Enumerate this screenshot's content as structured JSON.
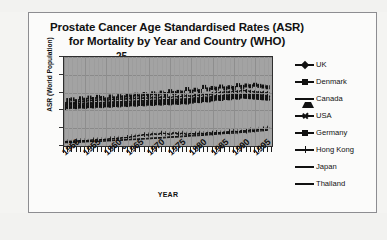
{
  "chart_data": {
    "type": "line",
    "title": "Prostate Cancer Age Standardised Rates (ASR) for Mortality by Year and Country (WHO)",
    "title_lines": [
      "Prostate Cancer Age Standardised Rates (ASR)",
      "for Mortality by Year and Country (WHO)"
    ],
    "xlabel": "YEAR",
    "ylabel": "ASR (World Population)",
    "xlim": [
      1950,
      1999
    ],
    "ylim": [
      0,
      25
    ],
    "yticks": [
      25,
      20,
      15,
      10,
      5,
      0
    ],
    "xticks": [
      1950,
      1955,
      1960,
      1965,
      1970,
      1975,
      1980,
      1985,
      1990,
      1995
    ],
    "grid": true,
    "plot_background": "#a3a3a3",
    "legend_position": "right",
    "x": [
      1950,
      1951,
      1952,
      1953,
      1954,
      1955,
      1956,
      1957,
      1958,
      1959,
      1960,
      1961,
      1962,
      1963,
      1964,
      1965,
      1966,
      1967,
      1968,
      1969,
      1970,
      1971,
      1972,
      1973,
      1974,
      1975,
      1976,
      1977,
      1978,
      1979,
      1980,
      1981,
      1982,
      1983,
      1984,
      1985,
      1986,
      1987,
      1988,
      1989,
      1990,
      1991,
      1992,
      1993,
      1994,
      1995,
      1996,
      1997,
      1998
    ],
    "series": [
      {
        "name": "UK",
        "marker": "diamond",
        "color": "#111111",
        "values": [
          12.1,
          12.3,
          12.0,
          12.4,
          12.6,
          12.5,
          12.8,
          12.7,
          12.9,
          13.0,
          12.8,
          13.1,
          13.0,
          13.2,
          13.1,
          13.3,
          13.2,
          13.4,
          13.3,
          13.5,
          13.4,
          13.6,
          13.5,
          13.7,
          13.8,
          13.6,
          13.9,
          13.8,
          14.0,
          14.1,
          14.0,
          14.3,
          14.2,
          14.5,
          14.4,
          14.7,
          14.9,
          15.0,
          15.2,
          15.1,
          15.4,
          15.3,
          15.6,
          15.5,
          15.3,
          15.2,
          15.1,
          15.0,
          14.9
        ]
      },
      {
        "name": "Denmark",
        "marker": "square",
        "color": "#111111",
        "values": [
          10.4,
          12.9,
          13.1,
          12.6,
          13.4,
          13.0,
          13.6,
          13.2,
          13.8,
          13.5,
          13.1,
          13.9,
          13.4,
          14.0,
          13.7,
          14.2,
          13.9,
          14.4,
          14.0,
          14.6,
          14.2,
          14.8,
          14.4,
          15.0,
          14.6,
          15.4,
          14.9,
          15.2,
          15.0,
          16.0,
          15.3,
          15.8,
          15.4,
          16.6,
          15.9,
          16.3,
          16.1,
          16.7,
          16.2,
          16.5,
          16.3,
          17.1,
          16.6,
          17.0,
          16.8,
          17.2,
          16.9,
          16.7,
          16.5
        ]
      },
      {
        "name": "Canada",
        "marker": "triangle",
        "color": "#111111",
        "values": [
          11.8,
          11.9,
          12.0,
          11.9,
          12.1,
          12.0,
          12.2,
          12.1,
          12.3,
          12.2,
          12.4,
          12.3,
          12.5,
          12.4,
          12.6,
          12.5,
          12.7,
          12.6,
          12.8,
          12.7,
          12.9,
          12.8,
          13.0,
          12.9,
          13.1,
          13.0,
          13.2,
          13.1,
          13.3,
          13.2,
          13.4,
          13.6,
          13.5,
          13.8,
          13.7,
          14.0,
          14.2,
          14.1,
          14.4,
          14.3,
          14.6,
          14.5,
          14.8,
          14.7,
          14.6,
          14.5,
          14.4,
          14.3,
          14.2
        ]
      },
      {
        "name": "USA",
        "marker": "cross",
        "color": "#111111",
        "values": [
          11.2,
          11.3,
          11.2,
          11.4,
          11.3,
          11.5,
          11.4,
          11.6,
          11.5,
          11.7,
          11.6,
          11.8,
          11.7,
          11.9,
          11.8,
          12.0,
          11.9,
          12.1,
          12.0,
          12.2,
          12.1,
          12.3,
          12.2,
          12.4,
          12.3,
          12.5,
          12.4,
          12.6,
          12.5,
          12.7,
          12.6,
          12.9,
          12.8,
          13.1,
          13.0,
          13.3,
          13.5,
          13.4,
          13.7,
          13.6,
          13.9,
          13.8,
          14.1,
          14.0,
          13.9,
          13.8,
          13.7,
          13.6,
          13.5
        ]
      },
      {
        "name": "Germany",
        "marker": "square",
        "color": "#111111",
        "values": [
          10.8,
          10.9,
          11.0,
          10.9,
          11.1,
          11.0,
          11.2,
          11.1,
          11.3,
          11.2,
          11.4,
          11.3,
          11.5,
          11.4,
          11.6,
          11.5,
          11.7,
          11.6,
          11.8,
          11.7,
          11.9,
          11.8,
          12.0,
          11.9,
          12.1,
          12.0,
          12.2,
          12.1,
          12.3,
          12.2,
          12.5,
          12.7,
          12.6,
          12.9,
          12.8,
          13.1,
          13.3,
          13.2,
          13.5,
          13.4,
          13.7,
          13.6,
          13.9,
          13.8,
          13.7,
          13.6,
          13.5,
          13.4,
          13.3
        ]
      },
      {
        "name": "Hong Kong",
        "marker": "plus",
        "color": "#111111",
        "values": [
          1.2,
          1.3,
          1.3,
          1.4,
          1.5,
          1.5,
          1.6,
          1.7,
          1.7,
          1.8,
          1.9,
          2.0,
          2.1,
          2.2,
          2.3,
          2.4,
          2.6,
          2.8,
          3.0,
          3.2,
          3.1,
          3.4,
          3.3,
          3.6,
          3.5,
          3.3,
          3.7,
          3.4,
          3.6,
          3.3,
          3.5,
          3.4,
          3.6,
          3.5,
          3.7,
          3.6,
          3.8,
          3.7,
          3.9,
          4.0,
          4.1,
          4.0,
          4.3,
          4.2,
          4.5,
          4.4,
          4.7,
          4.8,
          5.0
        ]
      },
      {
        "name": "Japan",
        "marker": "none",
        "color": "#111111",
        "values": [
          1.0,
          1.05,
          1.1,
          1.15,
          1.2,
          1.25,
          1.3,
          1.35,
          1.4,
          1.45,
          1.5,
          1.6,
          1.65,
          1.7,
          1.8,
          1.85,
          1.9,
          2.0,
          2.05,
          2.1,
          2.2,
          2.3,
          2.35,
          2.4,
          2.5,
          2.6,
          2.65,
          2.7,
          2.8,
          2.9,
          3.0,
          3.1,
          3.15,
          3.2,
          3.3,
          3.4,
          3.5,
          3.6,
          3.7,
          3.8,
          3.9,
          4.0,
          4.1,
          4.2,
          4.3,
          4.4,
          4.5,
          4.6,
          4.7
        ]
      },
      {
        "name": "Thailand",
        "marker": "none",
        "color": "#111111",
        "values": [
          0.9,
          0.95,
          1.0,
          1.05,
          1.1,
          1.15,
          1.2,
          1.25,
          1.3,
          1.35,
          1.4,
          1.45,
          1.5,
          1.55,
          1.6,
          1.7,
          1.75,
          1.8,
          1.9,
          1.95,
          2.0,
          2.1,
          2.15,
          2.2,
          2.3,
          2.4,
          2.45,
          2.5,
          2.6,
          2.7,
          2.8,
          2.85,
          2.9,
          3.0,
          3.1,
          3.2,
          3.3,
          3.4,
          3.5,
          3.55,
          3.6,
          3.7,
          3.8,
          3.9,
          4.0,
          4.1,
          4.2,
          4.3,
          4.4
        ]
      }
    ]
  },
  "legend": {
    "items": [
      {
        "label": "UK",
        "marker": "diamond"
      },
      {
        "label": "Denmark",
        "marker": "square"
      },
      {
        "label": "Canada",
        "marker": "triangle"
      },
      {
        "label": "USA",
        "marker": "cross"
      },
      {
        "label": "Germany",
        "marker": "square"
      },
      {
        "label": "Hong Kong",
        "marker": "plus"
      },
      {
        "label": "Japan",
        "marker": "none"
      },
      {
        "label": "Thailand",
        "marker": "none"
      }
    ]
  }
}
